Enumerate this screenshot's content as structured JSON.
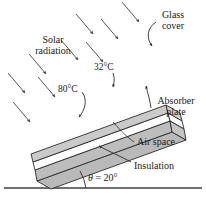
{
  "figure": {
    "type": "engineering-diagram",
    "colors": {
      "body_fill": "#b9b9b9",
      "glass_fill": "#c9c9c9",
      "air_gap_fill": "#ffffff",
      "outline": "#2b2b2b",
      "ground": "#6e6e6e",
      "arrow": "#3a3a3a",
      "text": "#1a1a1a"
    }
  },
  "labels": {
    "solar_radiation_line1": "Solar",
    "solar_radiation_line2": "radiation",
    "glass_cover_line1": "Glass",
    "glass_cover_line2": "cover",
    "absorber_plate_line1": "Absorber",
    "absorber_plate_line2": "plate",
    "air_space": "Air space",
    "insulation": "Insulation",
    "temp_glass": "32°C",
    "temp_absorber": "80°C",
    "angle_symbol": "θ",
    "angle_equals": " = ",
    "angle_value": "20°"
  },
  "annotations": {
    "solar_arrow_count": 9,
    "tilt_angle_degrees": 20,
    "glass_cover_temperature_c": 32,
    "absorber_plate_temperature_c": 80
  }
}
